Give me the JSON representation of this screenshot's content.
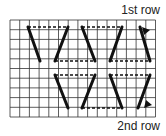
{
  "labels": {
    "row1": "1st row",
    "row2": "2nd row"
  },
  "grid": {
    "x0": 10,
    "y0": 20,
    "cols": 15,
    "rows": 10,
    "cell": 9.7,
    "color": "#333333"
  },
  "stitches": {
    "solid": [
      [
        28,
        27,
        40,
        61
      ],
      [
        68,
        27,
        55,
        61
      ],
      [
        82,
        27,
        95,
        61
      ],
      [
        122,
        27,
        110,
        61
      ],
      [
        140,
        27,
        150,
        61
      ],
      [
        55,
        75,
        68,
        108
      ],
      [
        95,
        75,
        82,
        108
      ],
      [
        110,
        75,
        122,
        108
      ],
      [
        150,
        75,
        138,
        108
      ]
    ],
    "dashed": [
      [
        28,
        27,
        68,
        27
      ],
      [
        55,
        61,
        95,
        61
      ],
      [
        82,
        27,
        122,
        27
      ],
      [
        110,
        61,
        150,
        61
      ],
      [
        55,
        75,
        95,
        75
      ],
      [
        82,
        108,
        122,
        108
      ],
      [
        110,
        75,
        150,
        75
      ]
    ],
    "arrows": [
      {
        "name": "row1-arrow",
        "tip": [
          142,
          27
        ],
        "dir": "up-left"
      },
      {
        "name": "row2-arrow",
        "tip": [
          144,
          108
        ],
        "dir": "down-left"
      }
    ],
    "color": "#111111"
  }
}
